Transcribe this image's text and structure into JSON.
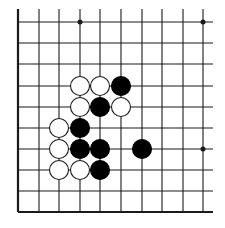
{
  "diagram": {
    "type": "go-board-fragment",
    "colors": {
      "background": "#ffffff",
      "line": "#1a1a1a",
      "black_stone": "#000000",
      "white_stone_fill": "#ffffff",
      "white_stone_stroke": "#1a1a1a"
    },
    "grid": {
      "columns_x": [
        18,
        39,
        59,
        80,
        100,
        121,
        142,
        162,
        183,
        203
      ],
      "rows_y": [
        22,
        43,
        64,
        86,
        107,
        128,
        149,
        170,
        191,
        212
      ],
      "line_extent": {
        "x_min": 18,
        "x_max": 213,
        "y_min": 9,
        "y_max": 212
      },
      "thick_edges": [
        "left",
        "bottom"
      ],
      "open_edges": [
        "top",
        "right"
      ]
    },
    "star_points": [
      {
        "col": 3,
        "row": 0
      },
      {
        "col": 9,
        "row": 0
      },
      {
        "col": 9,
        "row": 6
      }
    ],
    "stones": [
      {
        "color": "white",
        "col": 3,
        "row": 3
      },
      {
        "color": "white",
        "col": 4,
        "row": 3
      },
      {
        "color": "black",
        "col": 5,
        "row": 3
      },
      {
        "color": "white",
        "col": 3,
        "row": 4
      },
      {
        "color": "black",
        "col": 4,
        "row": 4
      },
      {
        "color": "white",
        "col": 5,
        "row": 4
      },
      {
        "color": "white",
        "col": 2,
        "row": 5
      },
      {
        "color": "black",
        "col": 3,
        "row": 5
      },
      {
        "color": "white",
        "col": 2,
        "row": 6
      },
      {
        "color": "black",
        "col": 3,
        "row": 6
      },
      {
        "color": "black",
        "col": 4,
        "row": 6
      },
      {
        "color": "black",
        "col": 6,
        "row": 6
      },
      {
        "color": "white",
        "col": 2,
        "row": 7
      },
      {
        "color": "white",
        "col": 3,
        "row": 7
      },
      {
        "color": "black",
        "col": 4,
        "row": 7
      }
    ],
    "stone_radius": 9.5,
    "star_radius": 2.5
  }
}
